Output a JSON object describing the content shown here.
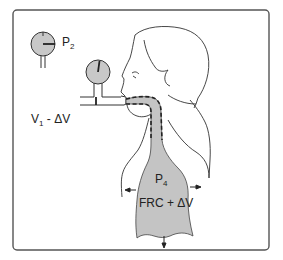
{
  "diagram": {
    "labels": {
      "gauge_p2": "P",
      "gauge_p2_sub": "2",
      "volume": "V",
      "volume_sub": "1",
      "volume_rest": " - ΔV",
      "lung_pressure": "P",
      "lung_pressure_sub": "4",
      "lung_volume": "FRC + ΔV"
    },
    "colors": {
      "frame": "#555555",
      "gauge_fill": "#c8c8c8",
      "lung_fill": "#c4c4c4",
      "line": "#333333"
    },
    "elements": [
      "frame",
      "gauge-p2",
      "gauge-mouth",
      "mouthpiece-tube",
      "head-profile",
      "airway",
      "lungs",
      "chest-outline",
      "expansion-arrows"
    ]
  }
}
